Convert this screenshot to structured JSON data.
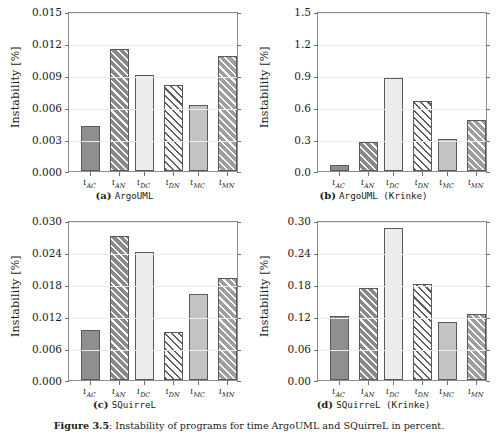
{
  "figure": {
    "caption_prefix": "Figure 3.5",
    "caption_text": ": Instability of programs for time  ArgoUML  and  SQuirreL  in percent.",
    "ylabel": "Instability [%]",
    "background_color": "#ffffff",
    "axis_color": "#8c8c8c",
    "grid_color": "#ededed"
  },
  "categories": [
    "ιAC",
    "ιAN",
    "ιDC",
    "ιDN",
    "ιMC",
    "ιMN"
  ],
  "category_parts": [
    {
      "base": "ι",
      "sub": "AC"
    },
    {
      "base": "ι",
      "sub": "AN"
    },
    {
      "base": "ι",
      "sub": "DC"
    },
    {
      "base": "ι",
      "sub": "DN"
    },
    {
      "base": "ι",
      "sub": "MC"
    },
    {
      "base": "ι",
      "sub": "MN"
    }
  ],
  "bar_styles": [
    "f-dark",
    "f-darkh",
    "f-light",
    "f-lighth",
    "f-mid",
    "f-midh"
  ],
  "style_names": [
    "solid-dark-gray",
    "hatched-dark-gray",
    "solid-light-gray",
    "hatched-white",
    "solid-mid-gray",
    "hatched-mid-gray"
  ],
  "panels": [
    {
      "id": "a",
      "caption_label": "(a)",
      "caption_name": "ArgoUML",
      "ylabel": "Instability [%]",
      "yticks": [
        "0.000",
        "0.003",
        "0.006",
        "0.009",
        "0.012",
        "0.015"
      ],
      "ytick_values": [
        0.0,
        0.003,
        0.006,
        0.009,
        0.012,
        0.015
      ],
      "ylim": [
        0.0,
        0.015
      ],
      "values": [
        0.0042,
        0.0114,
        0.009,
        0.0081,
        0.0062,
        0.0108
      ]
    },
    {
      "id": "b",
      "caption_label": "(b)",
      "caption_name": "ArgoUML (Krinke)",
      "ylabel": "Instability [%]",
      "yticks": [
        "0.0",
        "0.3",
        "0.6",
        "0.9",
        "1.2",
        "1.5"
      ],
      "ytick_values": [
        0.0,
        0.3,
        0.6,
        0.9,
        1.2,
        1.5
      ],
      "ylim": [
        0.0,
        1.5
      ],
      "values": [
        0.06,
        0.27,
        0.87,
        0.66,
        0.3,
        0.48
      ]
    },
    {
      "id": "c",
      "caption_label": "(c)",
      "caption_name": "SQuirreL",
      "ylabel": "Instability [%]",
      "yticks": [
        "0.000",
        "0.006",
        "0.012",
        "0.018",
        "0.024",
        "0.030"
      ],
      "ytick_values": [
        0.0,
        0.006,
        0.012,
        0.018,
        0.024,
        0.03
      ],
      "ylim": [
        0.0,
        0.03
      ],
      "values": [
        0.0093,
        0.027,
        0.024,
        0.009,
        0.0161,
        0.0192
      ]
    },
    {
      "id": "d",
      "caption_label": "(d)",
      "caption_name": "SQuirreL (Krinke)",
      "ylabel": "Instability [%]",
      "yticks": [
        "0.00",
        "0.06",
        "0.12",
        "0.18",
        "0.24",
        "0.30"
      ],
      "ytick_values": [
        0.0,
        0.06,
        0.12,
        0.18,
        0.24,
        0.3
      ],
      "ylim": [
        0.0,
        0.3
      ],
      "values": [
        0.12,
        0.172,
        0.285,
        0.18,
        0.108,
        0.124
      ]
    }
  ],
  "chart_data": [
    {
      "type": "bar",
      "title": "(a) ArgoUML",
      "categories": [
        "ιAC",
        "ιAN",
        "ιDC",
        "ιDN",
        "ιMC",
        "ιMN"
      ],
      "values": [
        0.0042,
        0.0114,
        0.009,
        0.0081,
        0.0062,
        0.0108
      ],
      "xlabel": "",
      "ylabel": "Instability [%]",
      "ylim": [
        0.0,
        0.015
      ],
      "yticks": [
        0.0,
        0.003,
        0.006,
        0.009,
        0.012,
        0.015
      ],
      "grid": true,
      "legend": "none"
    },
    {
      "type": "bar",
      "title": "(b) ArgoUML (Krinke)",
      "categories": [
        "ιAC",
        "ιAN",
        "ιDC",
        "ιDN",
        "ιMC",
        "ιMN"
      ],
      "values": [
        0.06,
        0.27,
        0.87,
        0.66,
        0.3,
        0.48
      ],
      "xlabel": "",
      "ylabel": "Instability [%]",
      "ylim": [
        0.0,
        1.5
      ],
      "yticks": [
        0.0,
        0.3,
        0.6,
        0.9,
        1.2,
        1.5
      ],
      "grid": true,
      "legend": "none"
    },
    {
      "type": "bar",
      "title": "(c) SQuirreL",
      "categories": [
        "ιAC",
        "ιAN",
        "ιDC",
        "ιDN",
        "ιMC",
        "ιMN"
      ],
      "values": [
        0.0093,
        0.027,
        0.024,
        0.009,
        0.0161,
        0.0192
      ],
      "xlabel": "",
      "ylabel": "Instability [%]",
      "ylim": [
        0.0,
        0.03
      ],
      "yticks": [
        0.0,
        0.006,
        0.012,
        0.018,
        0.024,
        0.03
      ],
      "grid": true,
      "legend": "none"
    },
    {
      "type": "bar",
      "title": "(d) SQuirreL (Krinke)",
      "categories": [
        "ιAC",
        "ιAN",
        "ιDC",
        "ιDN",
        "ιMC",
        "ιMN"
      ],
      "values": [
        0.12,
        0.172,
        0.285,
        0.18,
        0.108,
        0.124
      ],
      "xlabel": "",
      "ylabel": "Instability [%]",
      "ylim": [
        0.0,
        0.3
      ],
      "yticks": [
        0.0,
        0.06,
        0.12,
        0.18,
        0.24,
        0.3
      ],
      "grid": true,
      "legend": "none"
    }
  ]
}
